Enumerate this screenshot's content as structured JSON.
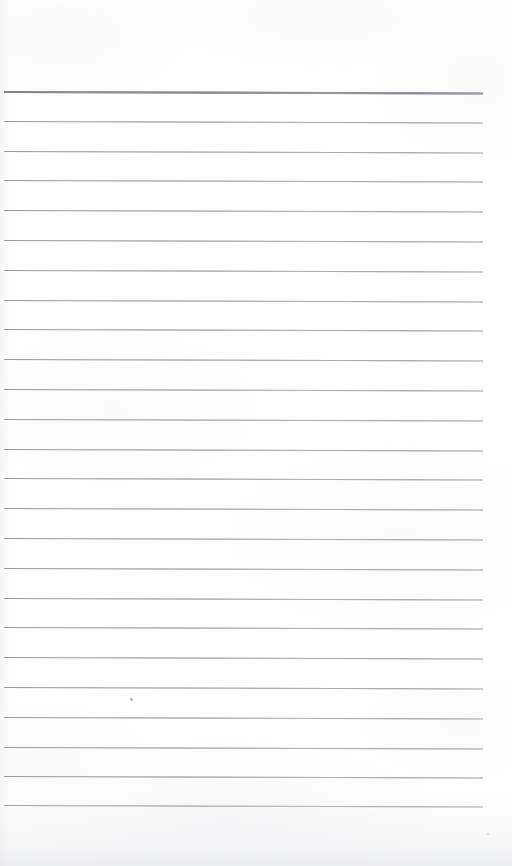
{
  "document": {
    "kind": "scanned-lined-notebook-page",
    "title": "Blank Lined Notebook Page",
    "page_width": 512,
    "page_height": 866,
    "paper_color": "#fefefe",
    "has_text_content": false,
    "written_content": "",
    "notes": "Blank ruled paper scan; no handwriting, no printed text, no page number."
  },
  "layout": {
    "rule_left_x": 4,
    "rule_right_x": 483,
    "top_margin": 91,
    "bottom_margin": 61,
    "left_margin": 4,
    "right_margin": 29,
    "line_spacing": 29.8,
    "line_count": 25,
    "skew_degrees": 0.18
  },
  "colors": {
    "paper": "#fefefe",
    "rule_line": "#b9bbc0",
    "header_rule_line": "#9a9da3",
    "edge_shadow": "#eeeff1",
    "speck": "#96989e"
  },
  "rules": [
    {
      "index": 0,
      "y": 91,
      "type": "header",
      "thickness": 2
    },
    {
      "index": 1,
      "y": 120.8,
      "type": "ruled",
      "thickness": 1
    },
    {
      "index": 2,
      "y": 150.6,
      "type": "ruled",
      "thickness": 1
    },
    {
      "index": 3,
      "y": 180.4,
      "type": "ruled",
      "thickness": 1
    },
    {
      "index": 4,
      "y": 210.2,
      "type": "ruled",
      "thickness": 1
    },
    {
      "index": 5,
      "y": 240.0,
      "type": "ruled",
      "thickness": 1
    },
    {
      "index": 6,
      "y": 269.8,
      "type": "ruled",
      "thickness": 1
    },
    {
      "index": 7,
      "y": 299.6,
      "type": "ruled",
      "thickness": 1
    },
    {
      "index": 8,
      "y": 329.4,
      "type": "ruled",
      "thickness": 1
    },
    {
      "index": 9,
      "y": 359.2,
      "type": "ruled",
      "thickness": 1
    },
    {
      "index": 10,
      "y": 389.0,
      "type": "ruled",
      "thickness": 1
    },
    {
      "index": 11,
      "y": 418.8,
      "type": "ruled",
      "thickness": 1
    },
    {
      "index": 12,
      "y": 448.6,
      "type": "ruled",
      "thickness": 1
    },
    {
      "index": 13,
      "y": 478.4,
      "type": "ruled",
      "thickness": 1
    },
    {
      "index": 14,
      "y": 508.2,
      "type": "ruled",
      "thickness": 1
    },
    {
      "index": 15,
      "y": 538.0,
      "type": "ruled",
      "thickness": 1
    },
    {
      "index": 16,
      "y": 567.8,
      "type": "ruled",
      "thickness": 1
    },
    {
      "index": 17,
      "y": 597.6,
      "type": "ruled",
      "thickness": 1
    },
    {
      "index": 18,
      "y": 627.4,
      "type": "ruled",
      "thickness": 1
    },
    {
      "index": 19,
      "y": 657.2,
      "type": "ruled",
      "thickness": 1
    },
    {
      "index": 20,
      "y": 687.0,
      "type": "ruled",
      "thickness": 1
    },
    {
      "index": 21,
      "y": 716.8,
      "type": "ruled",
      "thickness": 1
    },
    {
      "index": 22,
      "y": 746.6,
      "type": "ruled",
      "thickness": 1
    },
    {
      "index": 23,
      "y": 776.4,
      "type": "ruled",
      "thickness": 1
    },
    {
      "index": 24,
      "y": 805.0,
      "type": "ruled",
      "thickness": 1
    }
  ],
  "marks": [
    {
      "name": "ink-speck",
      "x": 130,
      "y": 698,
      "size": "small"
    },
    {
      "name": "edge-speck",
      "x": 487,
      "y": 833,
      "size": "tiny"
    }
  ]
}
